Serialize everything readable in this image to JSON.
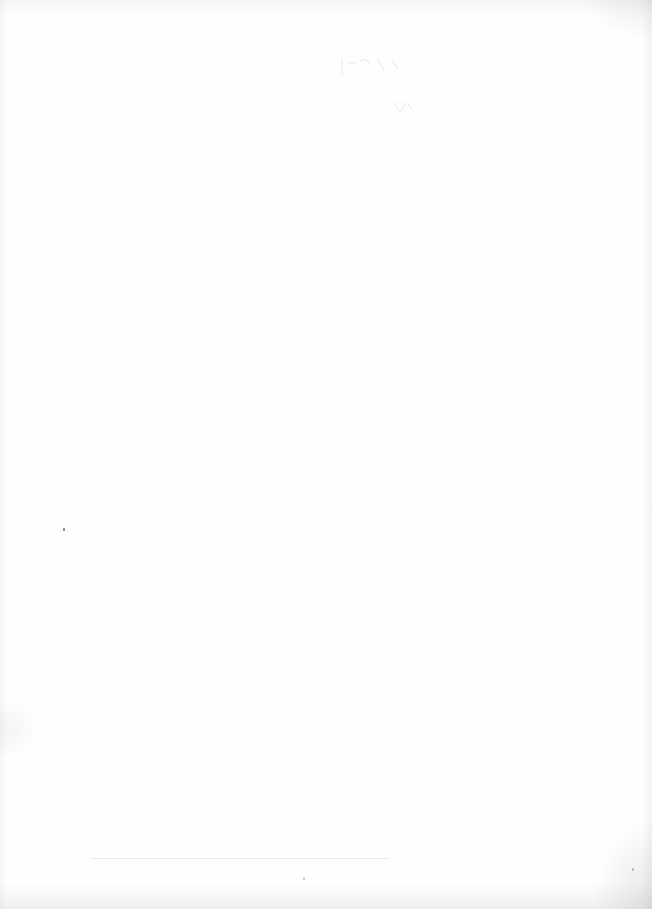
{
  "document": {
    "type": "scanned-page",
    "state": "blank",
    "visible_text": ""
  }
}
